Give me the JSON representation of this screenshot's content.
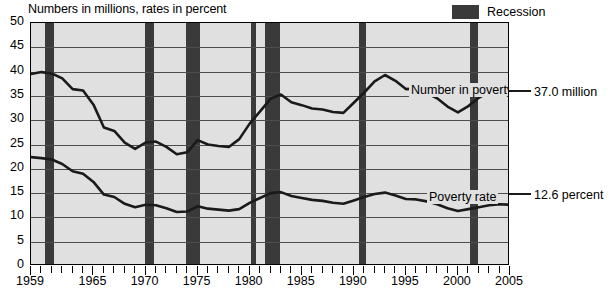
{
  "caption": "Numbers in millions, rates in percent",
  "legend": {
    "label": "Recession",
    "swatch_color": "#3a3a3a"
  },
  "annotations": {
    "number_in_poverty_label": "Number in poverty",
    "poverty_rate_label": "Poverty rate",
    "number_in_poverty_end": "37.0 million",
    "poverty_rate_end": "12.6 percent"
  },
  "axes": {
    "y_ticks": [
      "50",
      "45",
      "40",
      "35",
      "30",
      "25",
      "20",
      "15",
      "10",
      "5",
      "0"
    ],
    "x_ticks": [
      "1959",
      "1965",
      "1970",
      "1975",
      "1980",
      "1985",
      "1990",
      "1995",
      "2000",
      "2005"
    ]
  },
  "chart_data": {
    "type": "line",
    "title": "",
    "subtitle": "Numbers in millions, rates in percent",
    "xlabel": "",
    "ylabel": "",
    "ylim": [
      0,
      50
    ],
    "xlim": [
      1959,
      2005
    ],
    "grid": true,
    "legend_position": "top-right",
    "plot_background": "#e0e0e0",
    "x": [
      1959,
      1960,
      1961,
      1962,
      1963,
      1964,
      1965,
      1966,
      1967,
      1968,
      1969,
      1970,
      1971,
      1972,
      1973,
      1974,
      1975,
      1976,
      1977,
      1978,
      1979,
      1980,
      1981,
      1982,
      1983,
      1984,
      1985,
      1986,
      1987,
      1988,
      1989,
      1990,
      1991,
      1992,
      1993,
      1994,
      1995,
      1996,
      1997,
      1998,
      1999,
      2000,
      2001,
      2002,
      2003,
      2004,
      2005
    ],
    "series": [
      {
        "name": "Number in poverty",
        "unit": "millions",
        "end_label": "37.0 million",
        "values": [
          39.5,
          39.9,
          39.6,
          38.6,
          36.4,
          36.1,
          33.2,
          28.5,
          27.8,
          25.4,
          24.1,
          25.4,
          25.6,
          24.5,
          23.0,
          23.4,
          25.9,
          25.0,
          24.7,
          24.5,
          26.1,
          29.3,
          31.8,
          34.4,
          35.3,
          33.7,
          33.1,
          32.4,
          32.2,
          31.7,
          31.5,
          33.6,
          35.7,
          38.0,
          39.3,
          38.1,
          36.4,
          36.5,
          35.6,
          34.5,
          32.8,
          31.6,
          32.9,
          34.6,
          35.9,
          37.0,
          37.0
        ]
      },
      {
        "name": "Poverty rate",
        "unit": "percent",
        "end_label": "12.6 percent",
        "values": [
          22.4,
          22.2,
          21.9,
          21.0,
          19.5,
          19.0,
          17.3,
          14.7,
          14.2,
          12.8,
          12.1,
          12.6,
          12.5,
          11.9,
          11.1,
          11.2,
          12.3,
          11.8,
          11.6,
          11.4,
          11.7,
          13.0,
          14.0,
          15.0,
          15.2,
          14.4,
          14.0,
          13.6,
          13.4,
          13.0,
          12.8,
          13.5,
          14.2,
          14.8,
          15.1,
          14.5,
          13.8,
          13.7,
          13.3,
          12.7,
          11.9,
          11.3,
          11.7,
          12.1,
          12.5,
          12.7,
          12.6
        ]
      }
    ],
    "recession_bands": [
      {
        "start": 1960.3,
        "end": 1961.2
      },
      {
        "start": 1969.9,
        "end": 1970.8
      },
      {
        "start": 1973.9,
        "end": 1975.2
      },
      {
        "start": 1980.1,
        "end": 1980.6
      },
      {
        "start": 1981.5,
        "end": 1982.9
      },
      {
        "start": 1990.5,
        "end": 1991.2
      },
      {
        "start": 2001.2,
        "end": 2001.9
      }
    ]
  }
}
